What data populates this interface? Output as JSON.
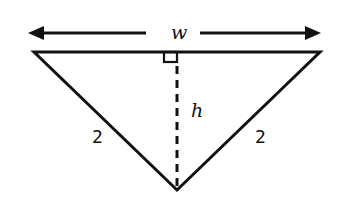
{
  "diagram": {
    "type": "isosceles-triangle",
    "labels": {
      "width": "w",
      "height": "h",
      "left_side": "2",
      "right_side": "2"
    },
    "annotations": {
      "width_arrow": "double-headed arrow spanning top edge, labeled w",
      "height_line": "dashed altitude from top edge midpoint to bottom vertex, labeled h",
      "right_angle_marker": "small square at top of altitude"
    },
    "colors": {
      "stroke": "#111111",
      "background": "#ffffff"
    }
  }
}
